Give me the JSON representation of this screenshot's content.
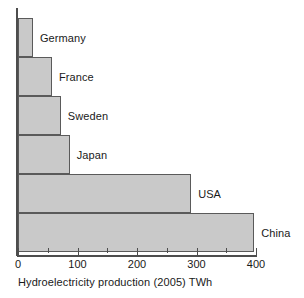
{
  "chart_data": {
    "type": "bar",
    "orientation": "horizontal",
    "title": "",
    "xlabel": "Hydroelectricity production (2005) TWh",
    "ylabel": "",
    "categories": [
      "Germany",
      "France",
      "Sweden",
      "Japan",
      "USA",
      "China"
    ],
    "values": [
      25,
      57,
      72,
      87,
      291,
      397
    ],
    "series": [
      {
        "name": "Hydroelectricity production (2005) TWh",
        "values": [
          25,
          57,
          72,
          87,
          291,
          397
        ]
      }
    ],
    "xlim": [
      0,
      400
    ],
    "xticks": [
      0,
      100,
      200,
      300,
      400
    ],
    "xtick_labels": [
      "0",
      "100",
      "200",
      "300",
      "400"
    ],
    "xticks_minor": [
      50,
      150,
      250,
      350
    ],
    "grid": false,
    "legend": false,
    "bar_fill_color": "#c9c9c9",
    "bar_edge_color": "#5a5a5a",
    "axis_color": "#4d4d4d",
    "text_color": "#1a1a1a",
    "background_color": "#ffffff"
  }
}
